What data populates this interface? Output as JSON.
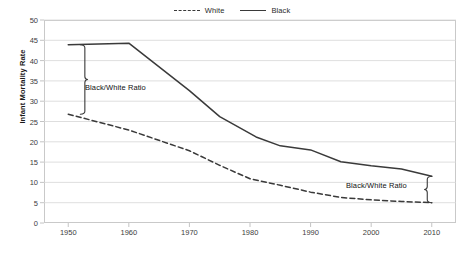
{
  "chart_data": {
    "type": "line",
    "title": "",
    "xlabel": "",
    "ylabel": "Infant Mortality Rate",
    "xlim": [
      1946,
      2014
    ],
    "ylim": [
      0,
      50
    ],
    "y_ticks": [
      0,
      5,
      10,
      15,
      20,
      25,
      30,
      35,
      40,
      45,
      50
    ],
    "x_ticks": [
      1950,
      1960,
      1970,
      1980,
      1990,
      2000,
      2010
    ],
    "grid": "horizontal",
    "legend_position": "top-center",
    "series": [
      {
        "name": "White",
        "style": "dashed",
        "color": "#3a3a3a",
        "x": [
          1950,
          1960,
          1970,
          1975,
          1980,
          1985,
          1990,
          1995,
          2000,
          2005,
          2010
        ],
        "values": [
          26.8,
          22.9,
          17.8,
          14.2,
          10.9,
          9.3,
          7.6,
          6.3,
          5.7,
          5.3,
          5.0
        ]
      },
      {
        "name": "Black",
        "style": "solid",
        "color": "#3a3a3a",
        "x": [
          1950,
          1960,
          1970,
          1975,
          1981,
          1985,
          1990,
          1995,
          2000,
          2005,
          2010
        ],
        "values": [
          43.9,
          44.3,
          32.6,
          26.2,
          21.2,
          19.0,
          18.0,
          15.1,
          14.1,
          13.3,
          11.5
        ]
      }
    ],
    "annotations": [
      {
        "id": "left",
        "text": "Black/White Ratio",
        "x": 1952,
        "y_top": 43.9,
        "y_bottom": 26.8
      },
      {
        "id": "right",
        "text": "Black/White Ratio",
        "x": 2010,
        "y_top": 11.5,
        "y_bottom": 5.0
      }
    ]
  },
  "legend": {
    "items": [
      {
        "label": "White",
        "style": "dashed"
      },
      {
        "label": "Black",
        "style": "solid"
      }
    ]
  },
  "axes": {
    "y_title": "Infant Mortality Rate",
    "y_tick_labels": [
      "50",
      "45",
      "40",
      "35",
      "30",
      "25",
      "20",
      "15",
      "10",
      "5",
      "0"
    ],
    "x_tick_labels": [
      "1950",
      "1960",
      "1970",
      "1980",
      "1990",
      "2000",
      "2010"
    ]
  },
  "colors": {
    "line": "#3a3a3a",
    "grid": "#d6d6d6",
    "frame": "#c9c9c9",
    "text": "#3d3d3d",
    "annotation_text": "#111111"
  }
}
